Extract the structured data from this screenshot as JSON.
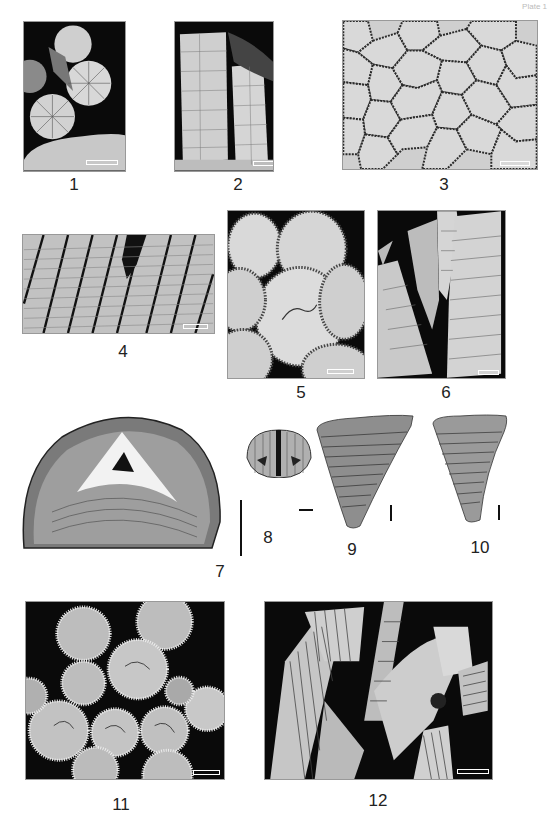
{
  "plate": {
    "corner_mark": "Plate 1",
    "background": "#ffffff",
    "panels": [
      {
        "id": 1,
        "label": "1",
        "description": "transverse and longitudinal sections of corallites, dark matrix"
      },
      {
        "id": 2,
        "label": "2",
        "description": "longitudinal sections of two corallites"
      },
      {
        "id": 3,
        "label": "3",
        "description": "cerioid colony, polygonal corallites"
      },
      {
        "id": 4,
        "label": "4",
        "description": "longitudinal section, parallel corallites with tabulae"
      },
      {
        "id": 5,
        "label": "5",
        "description": "transverse sections of rounded corallites"
      },
      {
        "id": 6,
        "label": "6",
        "description": "longitudinal sections, corallites with dissepiments"
      },
      {
        "id": 7,
        "label": "7",
        "description": "semicircular cross-section with triangular center"
      },
      {
        "id": 8,
        "label": "8",
        "description": "small semicircular section with median septum"
      },
      {
        "id": 9,
        "label": "9",
        "description": "triangular wedge-shaped specimen"
      },
      {
        "id": 10,
        "label": "10",
        "description": "triangular wedge-shaped specimen"
      },
      {
        "id": 11,
        "label": "11",
        "description": "transverse sections of phaceloid corallites, dark matrix"
      },
      {
        "id": 12,
        "label": "12",
        "description": "longitudinal sections of corallites, dark matrix"
      }
    ],
    "colors": {
      "matrix_dark": "#0a0a0a",
      "specimen_light": "#d9d9d9",
      "specimen_mid": "#9a9a9a",
      "label_text": "#222222"
    }
  }
}
